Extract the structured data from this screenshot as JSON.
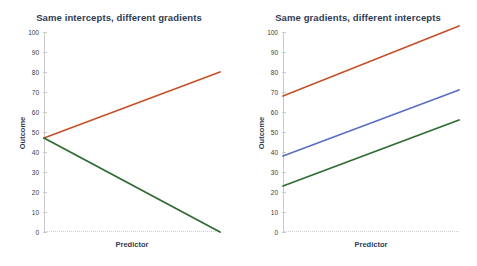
{
  "figure": {
    "background": "#ffffff",
    "title_color": "#2f3b52"
  },
  "chart_data": [
    {
      "type": "line",
      "title": "Same intercepts, different gradients",
      "xlabel": "Predictor",
      "ylabel": "Outcome",
      "ylim": [
        0,
        100
      ],
      "xlim": [
        0,
        100
      ],
      "yticks": [
        0,
        10,
        20,
        30,
        40,
        50,
        60,
        70,
        80,
        90,
        100
      ],
      "ytick_labels": [
        "0",
        "10",
        "20",
        "30",
        "40",
        "50",
        "60",
        "70",
        "80",
        "90",
        "100"
      ],
      "xticks": [],
      "grid": false,
      "legend": "none",
      "series": [
        {
          "name": "positive gradient",
          "color": "#c4522a",
          "x": [
            0,
            100
          ],
          "values": [
            47,
            80
          ]
        },
        {
          "name": "negative gradient",
          "color": "#2f6b32",
          "x": [
            0,
            100
          ],
          "values": [
            47,
            0
          ]
        }
      ]
    },
    {
      "type": "line",
      "title": "Same gradients, different intercepts",
      "xlabel": "Predictor",
      "ylabel": "Outcome",
      "ylim": [
        0,
        100
      ],
      "xlim": [
        0,
        100
      ],
      "yticks": [
        0,
        10,
        20,
        30,
        40,
        50,
        60,
        70,
        80,
        90,
        100
      ],
      "ytick_labels": [
        "0",
        "10",
        "20",
        "30",
        "40",
        "50",
        "60",
        "70",
        "80",
        "90",
        "100"
      ],
      "xticks": [],
      "grid": false,
      "legend": "none",
      "series": [
        {
          "name": "high intercept",
          "color": "#c4522a",
          "x": [
            0,
            100
          ],
          "values": [
            68,
            103
          ]
        },
        {
          "name": "mid intercept",
          "color": "#5b6fc0",
          "x": [
            0,
            100
          ],
          "values": [
            38,
            71
          ]
        },
        {
          "name": "low intercept",
          "color": "#2f6b32",
          "x": [
            0,
            100
          ],
          "values": [
            23,
            56
          ]
        }
      ]
    }
  ]
}
